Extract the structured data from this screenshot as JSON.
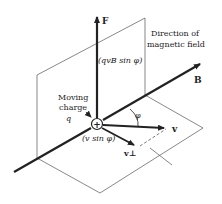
{
  "diagram": {
    "labels": {
      "force": "F",
      "force_magnitude": "(qvB sin φ)",
      "field_direction_line1": "Direction of",
      "field_direction_line2": "magnetic field",
      "field": "B",
      "charge_line1": "Moving",
      "charge_line2": "charge",
      "charge_symbol": "q",
      "charge_sign": "+",
      "velocity": "v",
      "angle": "φ",
      "perp_component": "(v sin φ)",
      "velocity_perp": "v⊥"
    },
    "colors": {
      "stroke": "#222222",
      "plane": "#555555",
      "background": "#ffffff"
    }
  }
}
